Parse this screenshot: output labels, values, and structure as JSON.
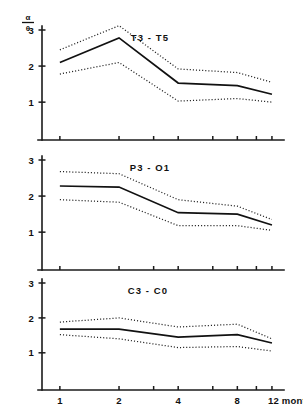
{
  "figure": {
    "yaxis_unit_numerator": "α",
    "yaxis_unit_denominator": "θ",
    "xaxis_caption": "12 months",
    "line_color": "#111111",
    "ci_color": "#222222",
    "axis_color": "#1a1a1a",
    "background": "#ffffff"
  },
  "chart_data": {
    "type": "line",
    "title": "",
    "xlabel": "months",
    "ylabel": "α/θ",
    "xlim": [
      0.85,
      13.5
    ],
    "ylim": [
      0,
      3.35
    ],
    "xscale": "log",
    "grid": false,
    "legend": "none",
    "xticks": [
      1,
      2,
      3,
      4,
      6,
      8,
      10,
      12
    ],
    "xticklabels": [
      "1",
      "2",
      "",
      "4",
      "",
      "8",
      "",
      "12 months"
    ],
    "yticks": [
      1,
      2,
      3
    ],
    "yticklabels": [
      "1",
      "2",
      "3"
    ],
    "panels": [
      {
        "label": "T3 - T5",
        "x": [
          1,
          2,
          4,
          8,
          12
        ],
        "series": [
          {
            "name": "upper confidence limit",
            "style": "dotted",
            "values": [
              2.45,
              3.12,
              1.92,
              1.82,
              1.55
            ]
          },
          {
            "name": "mean",
            "style": "solid",
            "values": [
              2.1,
              2.78,
              1.53,
              1.46,
              1.22
            ]
          },
          {
            "name": "lower confidence limit",
            "style": "dotted",
            "values": [
              1.78,
              2.1,
              1.03,
              1.1,
              1.0
            ]
          }
        ]
      },
      {
        "label": "P3 - O1",
        "x": [
          1,
          2,
          4,
          8,
          12
        ],
        "series": [
          {
            "name": "upper confidence limit",
            "style": "dotted",
            "values": [
              2.68,
              2.62,
              1.9,
              1.72,
              1.35
            ]
          },
          {
            "name": "mean",
            "style": "solid",
            "values": [
              2.28,
              2.25,
              1.54,
              1.5,
              1.2
            ]
          },
          {
            "name": "lower confidence limit",
            "style": "dotted",
            "values": [
              1.9,
              1.83,
              1.18,
              1.18,
              1.05
            ]
          }
        ]
      },
      {
        "label": "C3 - C0",
        "x": [
          1,
          2,
          4,
          8,
          12
        ],
        "series": [
          {
            "name": "upper confidence limit",
            "style": "dotted",
            "values": [
              1.88,
              2.0,
              1.74,
              1.82,
              1.4
            ]
          },
          {
            "name": "mean",
            "style": "solid",
            "values": [
              1.68,
              1.68,
              1.45,
              1.52,
              1.28
            ]
          },
          {
            "name": "lower confidence limit",
            "style": "dotted",
            "values": [
              1.52,
              1.4,
              1.15,
              1.18,
              1.05
            ]
          }
        ]
      }
    ]
  }
}
